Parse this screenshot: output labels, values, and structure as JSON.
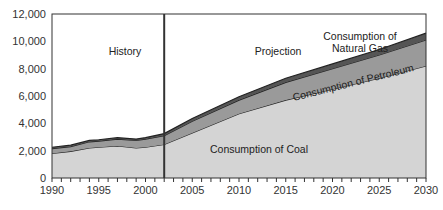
{
  "chart_data": {
    "type": "area",
    "title": "",
    "xlabel": "",
    "ylabel": "",
    "xlim": [
      1990,
      2030
    ],
    "ylim": [
      0,
      12000
    ],
    "grid": false,
    "x": [
      1990,
      1992,
      1994,
      1995,
      1997,
      1999,
      2000,
      2002,
      2005,
      2010,
      2015,
      2020,
      2025,
      2030
    ],
    "series": [
      {
        "name": "Consumption of Coal",
        "values": [
          1800,
          1950,
          2200,
          2250,
          2350,
          2200,
          2250,
          2450,
          3300,
          4700,
          5700,
          6500,
          7300,
          8200
        ]
      },
      {
        "name": "Consumption of Petroleum",
        "values": [
          350,
          350,
          450,
          450,
          500,
          550,
          600,
          650,
          850,
          1000,
          1300,
          1500,
          1700,
          1900
        ]
      },
      {
        "name": "Consumption of Natural Gas",
        "values": [
          100,
          100,
          100,
          100,
          100,
          100,
          100,
          150,
          200,
          250,
          300,
          350,
          400,
          500
        ]
      }
    ],
    "annotations": [
      "History",
      "Projection"
    ],
    "divider_year": 2002,
    "yticks": [
      "0",
      "2,000",
      "4,000",
      "6,000",
      "8,000",
      "10,000",
      "12,000"
    ],
    "xticks": [
      "1990",
      "1995",
      "2000",
      "2005",
      "2010",
      "2015",
      "2020",
      "2025",
      "2030"
    ],
    "labels": {
      "coal": "Consumption of Coal",
      "petroleum": "Consumption of Petroleum",
      "gas_line1": "Consumption of",
      "gas_line2": "Natural Gas",
      "history": "History",
      "projection": "Projection"
    }
  }
}
